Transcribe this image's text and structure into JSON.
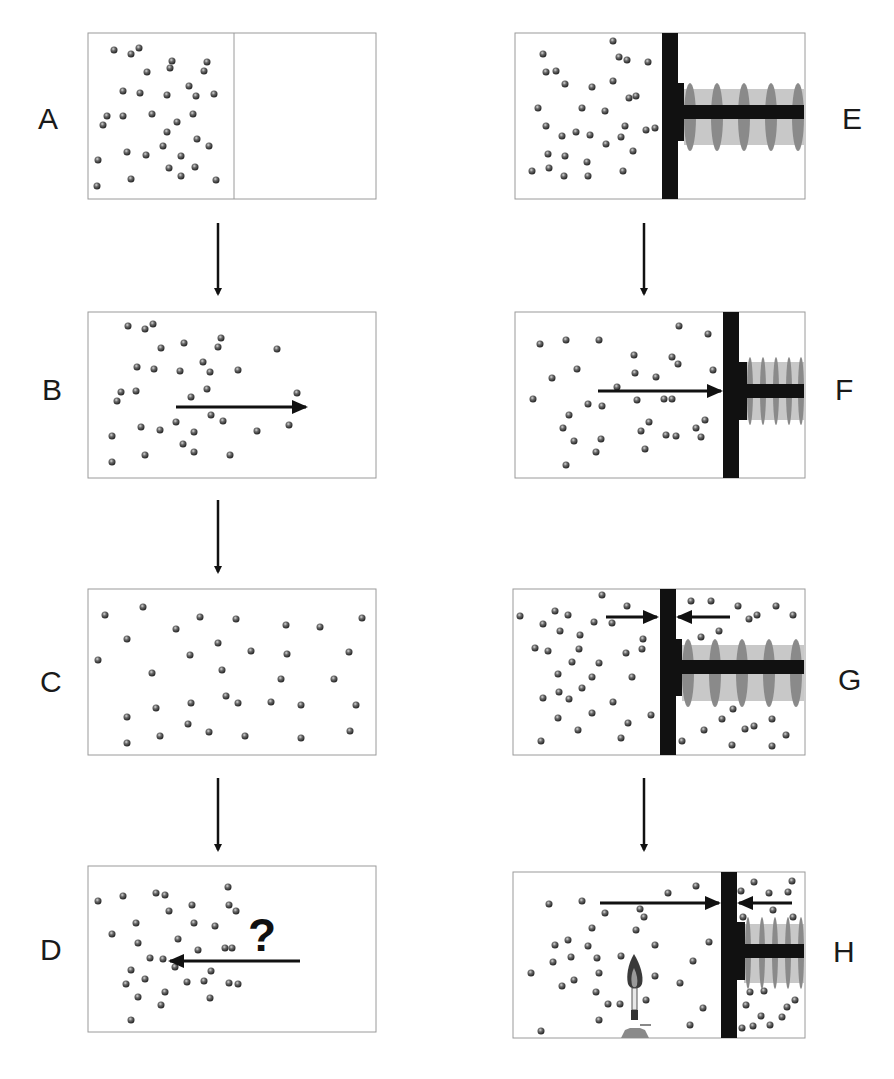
{
  "figure": {
    "panels": [
      {
        "id": "A",
        "label": "A",
        "content": "Gas confined to left half of box by partition; right half empty"
      },
      {
        "id": "B",
        "label": "B",
        "content": "Partition removed; gas expands to the right (arrow pointing right)"
      },
      {
        "id": "C",
        "label": "C",
        "content": "Gas uniformly fills the entire box"
      },
      {
        "id": "D",
        "label": "D",
        "content": "Question: will gas spontaneously return to the left? (arrow pointing left)",
        "annotation": "?"
      },
      {
        "id": "E",
        "label": "E",
        "content": "Gas on left side of piston attached to spring"
      },
      {
        "id": "F",
        "label": "F",
        "content": "Gas pushes piston right, compressing spring (arrow pointing right)"
      },
      {
        "id": "G",
        "label": "G",
        "content": "Gas on both sides of piston; equal opposing pressures (arrows pointing toward piston)"
      },
      {
        "id": "H",
        "label": "H",
        "content": "Left gas heated by burner; piston pushed right, compressing spring and right gas"
      }
    ],
    "flow_arrows": [
      {
        "from": "A",
        "to": "B"
      },
      {
        "from": "B",
        "to": "C"
      },
      {
        "from": "C",
        "to": "D"
      },
      {
        "from": "E",
        "to": "F"
      },
      {
        "from": "G",
        "to": "H"
      }
    ],
    "colors": {
      "particle": "#555555",
      "piston": "#111111",
      "spring_coil": "#8a8a8a",
      "spring_band": "#c8c8c8",
      "border": "#9a9a9a",
      "arrow": "#111111"
    }
  }
}
